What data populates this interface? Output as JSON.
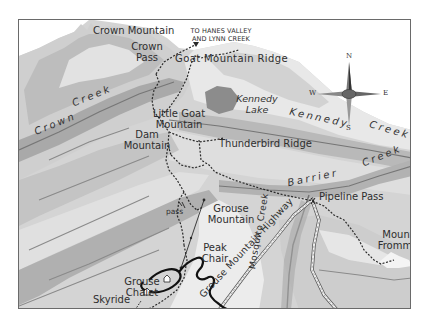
{
  "map": {
    "type": "trail-map",
    "colors": {
      "background": "#ffffff",
      "terrain_light": "#e6e6e6",
      "terrain_mid": "#cfcfcf",
      "terrain_dark": "#b4b4b4",
      "valley": "#a9a9a9",
      "lake": "#8a8a8a",
      "creek": "#7a7a7a",
      "trail": "#2a2a2a",
      "road": "#555555",
      "frame": "#6a6a6a",
      "label": "#2e2e2e"
    },
    "peaks": [
      {
        "name": "Crown Mountain",
        "label": "Crown Mountain"
      },
      {
        "name": "Crown Pass",
        "label_line1": "Crown",
        "label_line2": "Pass"
      },
      {
        "name": "Goat Mountain Ridge",
        "label": "Goat  Mountain  Ridge"
      },
      {
        "name": "Little Goat Mountain",
        "label_line1": "Little Goat",
        "label_line2": "Mountain"
      },
      {
        "name": "Dam Mountain",
        "label_line1": "Dam",
        "label_line2": "Mountain"
      },
      {
        "name": "Thunderbird Ridge",
        "label": "Thunderbird  Ridge"
      },
      {
        "name": "Grouse Mountain",
        "label_line1": "Grouse",
        "label_line2": "Mountain"
      },
      {
        "name": "Pipeline Pass",
        "label": "Pipeline Pass"
      },
      {
        "name": "Mount Fromme",
        "label_line1": "Mount",
        "label_line2": "Fromme"
      }
    ],
    "creeks": [
      {
        "name": "Crown Creek",
        "word1": "Crown",
        "word2": "Creek"
      },
      {
        "name": "Kennedy Creek",
        "word1": "Kennedy",
        "word2": "Creek"
      },
      {
        "name": "Barrier Creek",
        "word1": "Barrier",
        "word2": "Creek"
      },
      {
        "name": "Mosquito Creek",
        "label": "Mosquito  Creek"
      }
    ],
    "lake": {
      "line1": "Kennedy",
      "line2": "Lake"
    },
    "facilities": {
      "peak_chair": {
        "line1": "Peak",
        "line2": "Chair"
      },
      "grouse_chalet": {
        "line1": "Grouse",
        "line2": "Chalet"
      },
      "skyride": "Skyride",
      "pass_marker": "pass"
    },
    "road": {
      "label": "Grouse  Mountain  Highway"
    },
    "direction_note": {
      "line1": "TO HANES VALLEY",
      "line2": "AND LYNN CREEK"
    },
    "compass": {
      "n": "N",
      "s": "S",
      "e": "E",
      "w": "W"
    }
  }
}
